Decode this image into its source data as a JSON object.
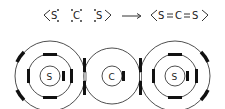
{
  "equation": {
    "reactants": {
      "atoms": [
        "S",
        "C",
        "S"
      ],
      "bracket_open": "<",
      "bracket_close": ">"
    },
    "arrow": "→",
    "product": {
      "text_parts": [
        "S",
        "=",
        "C",
        "=",
        "S"
      ]
    }
  },
  "diagram": {
    "atoms": [
      {
        "symbol": "S",
        "role": "left-sulfur"
      },
      {
        "symbol": "C",
        "role": "central-carbon"
      },
      {
        "symbol": "S",
        "role": "right-sulfur"
      }
    ],
    "colors": {
      "line": "#1a1a1a",
      "background": "#ffffff"
    }
  }
}
